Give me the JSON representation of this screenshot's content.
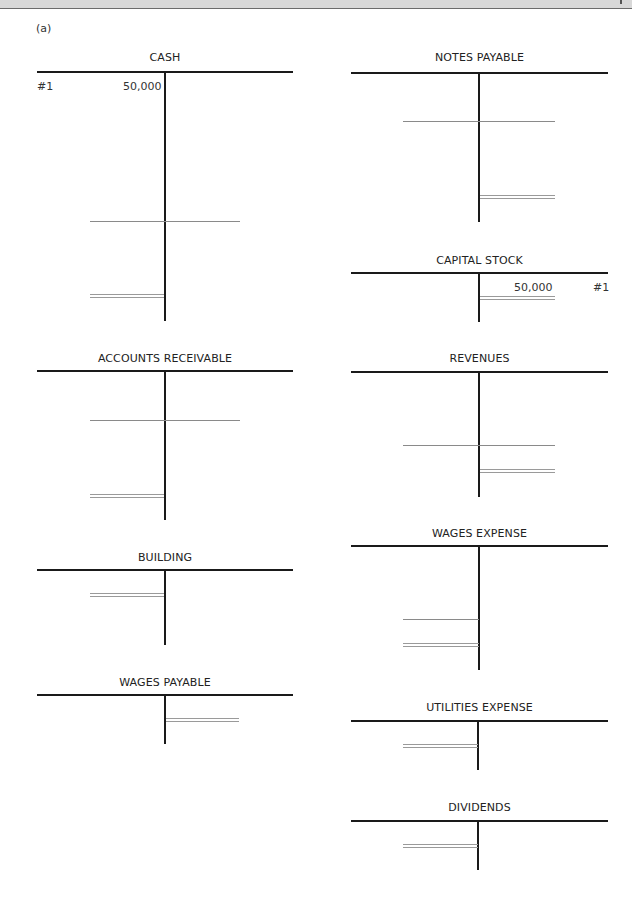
{
  "page": {
    "part_label": "(a)"
  },
  "accounts": {
    "cash": {
      "title": "CASH",
      "entries": [
        {
          "ref": "#1",
          "side": "debit",
          "amount": "50,000"
        }
      ]
    },
    "notes_payable": {
      "title": "NOTES PAYABLE",
      "entries": []
    },
    "capital_stock": {
      "title": "CAPITAL STOCK",
      "entries": [
        {
          "ref": "#1",
          "side": "credit",
          "amount": "50,000"
        }
      ]
    },
    "accounts_receivable": {
      "title": "ACCOUNTS RECEIVABLE",
      "entries": []
    },
    "revenues": {
      "title": "REVENUES",
      "entries": []
    },
    "building": {
      "title": "BUILDING",
      "entries": []
    },
    "wages_expense": {
      "title": "WAGES EXPENSE",
      "entries": []
    },
    "wages_payable": {
      "title": "WAGES PAYABLE",
      "entries": []
    },
    "utilities_expense": {
      "title": "UTILITIES EXPENSE",
      "entries": []
    },
    "dividends": {
      "title": "DIVIDENDS",
      "entries": []
    }
  }
}
